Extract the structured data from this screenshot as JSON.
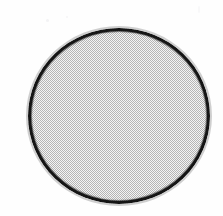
{
  "figure": {
    "background_color": "#fefefe",
    "shape": {
      "kind": "circle",
      "label": "gray-filled-circle",
      "fill_color": "#c3c3c3",
      "fill_pattern": "halftone-dither",
      "outline_color": "#151515",
      "outline_width_px": 3,
      "center_x_px": 119,
      "center_y_px": 116,
      "width_px": 182,
      "height_px": 176,
      "left_px": 28,
      "top_px": 28
    },
    "canvas": {
      "width_px": 223,
      "height_px": 216
    },
    "annotations": [],
    "text_content": []
  }
}
